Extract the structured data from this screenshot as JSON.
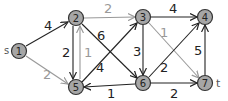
{
  "graph": {
    "source_label": "s",
    "sink_label": "t",
    "nodes": [
      {
        "id": "1",
        "label": "1",
        "x": 19,
        "y": 51
      },
      {
        "id": "2",
        "label": "2",
        "x": 76,
        "y": 18
      },
      {
        "id": "3",
        "label": "3",
        "x": 143,
        "y": 17
      },
      {
        "id": "4",
        "label": "4",
        "x": 205,
        "y": 17
      },
      {
        "id": "5",
        "label": "5",
        "x": 76,
        "y": 87
      },
      {
        "id": "6",
        "label": "6",
        "x": 143,
        "y": 83
      },
      {
        "id": "7",
        "label": "7",
        "x": 205,
        "y": 83
      }
    ],
    "edges": [
      {
        "from": "1",
        "to": "2",
        "weight": "4",
        "color": "#222222"
      },
      {
        "from": "1",
        "to": "5",
        "weight": "2",
        "color": "#999999"
      },
      {
        "from": "2",
        "to": "3",
        "weight": "2",
        "color": "#999999"
      },
      {
        "from": "2",
        "to": "5",
        "weight": "2",
        "color": "#222222"
      },
      {
        "from": "5",
        "to": "2",
        "weight": "1",
        "color": "#999999"
      },
      {
        "from": "2",
        "to": "6",
        "weight": "6",
        "color": "#222222"
      },
      {
        "from": "5",
        "to": "3",
        "weight": "4",
        "color": "#222222"
      },
      {
        "from": "3",
        "to": "4",
        "weight": "4",
        "color": "#222222"
      },
      {
        "from": "3",
        "to": "6",
        "weight": "3",
        "color": "#222222"
      },
      {
        "from": "3",
        "to": "7",
        "weight": "1",
        "color": "#999999"
      },
      {
        "from": "6",
        "to": "5",
        "weight": "1",
        "color": "#222222"
      },
      {
        "from": "6",
        "to": "4",
        "weight": "2",
        "color": "#222222"
      },
      {
        "from": "6",
        "to": "7",
        "weight": "2",
        "color": "#222222"
      },
      {
        "from": "7",
        "to": "4",
        "weight": "5",
        "color": "#222222"
      }
    ],
    "node_fill": "#a6a6a6",
    "node_stroke": "#333333"
  }
}
